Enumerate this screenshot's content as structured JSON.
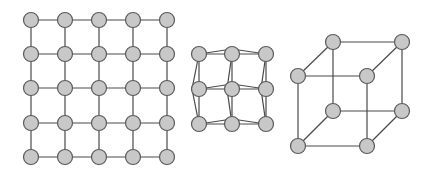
{
  "colors": {
    "background": "#ffffff",
    "node_fill": "#c8c8c8",
    "node_stroke": "#5a5a5a",
    "edge": "#4a4a4a"
  },
  "node_radius": 7.5,
  "figures": [
    {
      "name": "square-lattice-5x5",
      "type": "grid",
      "xs": [
        31,
        65,
        99,
        133,
        167
      ],
      "ys": [
        20,
        54,
        88,
        123,
        157
      ]
    },
    {
      "name": "distorted-lattice-3x3",
      "type": "distorted-grid",
      "nodes": [
        [
          199,
          54
        ],
        [
          232,
          54
        ],
        [
          266,
          54
        ],
        [
          199,
          89
        ],
        [
          232,
          89
        ],
        [
          266,
          89
        ],
        [
          199,
          124
        ],
        [
          232,
          124
        ],
        [
          266,
          124
        ]
      ],
      "edges": [
        [
          0,
          1
        ],
        [
          1,
          2
        ],
        [
          3,
          4
        ],
        [
          4,
          5
        ],
        [
          6,
          7
        ],
        [
          7,
          8
        ],
        [
          0,
          3
        ],
        [
          3,
          6
        ],
        [
          1,
          4
        ],
        [
          4,
          7
        ],
        [
          2,
          5
        ],
        [
          5,
          8
        ]
      ],
      "cross_edges": [
        [
          [
            199,
            54
          ],
          [
            232,
            49
          ],
          [
            266,
            54
          ]
        ],
        [
          [
            199,
            89
          ],
          [
            232,
            84
          ],
          [
            266,
            89
          ]
        ],
        [
          [
            199,
            124
          ],
          [
            232,
            119
          ],
          [
            266,
            124
          ]
        ],
        [
          [
            199,
            54
          ],
          [
            192,
            89
          ],
          [
            199,
            124
          ]
        ],
        [
          [
            232,
            54
          ],
          [
            227,
            89
          ],
          [
            232,
            124
          ]
        ],
        [
          [
            266,
            54
          ],
          [
            261,
            89
          ],
          [
            266,
            124
          ]
        ]
      ]
    },
    {
      "name": "cube",
      "type": "graph",
      "nodes": [
        [
          333,
          42
        ],
        [
          402,
          42
        ],
        [
          298,
          76
        ],
        [
          367,
          76
        ],
        [
          333,
          111
        ],
        [
          402,
          111
        ],
        [
          298,
          146
        ],
        [
          367,
          146
        ]
      ],
      "edges": [
        [
          0,
          1
        ],
        [
          2,
          3
        ],
        [
          0,
          2
        ],
        [
          1,
          3
        ],
        [
          4,
          5
        ],
        [
          6,
          7
        ],
        [
          4,
          6
        ],
        [
          5,
          7
        ],
        [
          0,
          4
        ],
        [
          1,
          5
        ],
        [
          2,
          6
        ],
        [
          3,
          7
        ]
      ]
    }
  ]
}
